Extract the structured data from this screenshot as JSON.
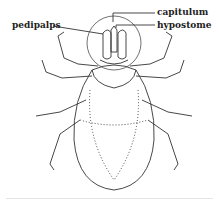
{
  "figure": {
    "labels": [
      {
        "id": "capitulum",
        "text": "capitulum"
      },
      {
        "id": "hypostome",
        "text": "hypostome"
      },
      {
        "id": "pedipalps",
        "text": "pedipalps"
      }
    ]
  }
}
